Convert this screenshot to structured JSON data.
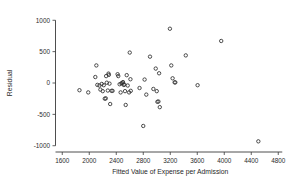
{
  "chart_data": {
    "type": "scatter",
    "title": "",
    "xlabel": "Fitted Value of Expense per Admission",
    "ylabel": "Residual",
    "xlim": [
      1500,
      4900
    ],
    "ylim": [
      -1100,
      1100
    ],
    "xticks": [
      1600,
      2000,
      2400,
      2800,
      3200,
      3600,
      4000,
      4400,
      4800
    ],
    "xtick_labels": [
      "1600",
      "2000",
      "2400",
      "2800",
      "3200",
      "3600",
      "4000",
      "4400",
      "4800"
    ],
    "yticks": [
      -1000,
      -500,
      0,
      500,
      1000
    ],
    "ytick_labels": [
      "-1000",
      "-500",
      "0",
      "500",
      "1000"
    ],
    "grid": false,
    "legend": null,
    "marker": "open-circle",
    "marker_color": "#2e2e2e",
    "points": [
      {
        "x": 1855,
        "y": -115
      },
      {
        "x": 1985,
        "y": -150
      },
      {
        "x": 2090,
        "y": 95
      },
      {
        "x": 2105,
        "y": 280
      },
      {
        "x": 2120,
        "y": -30
      },
      {
        "x": 2150,
        "y": -40
      },
      {
        "x": 2165,
        "y": -105
      },
      {
        "x": 2185,
        "y": -15
      },
      {
        "x": 2200,
        "y": -130
      },
      {
        "x": 2215,
        "y": -35
      },
      {
        "x": 2230,
        "y": -250
      },
      {
        "x": 2245,
        "y": -245
      },
      {
        "x": 2250,
        "y": 110
      },
      {
        "x": 2260,
        "y": 5
      },
      {
        "x": 2275,
        "y": -120
      },
      {
        "x": 2285,
        "y": 150
      },
      {
        "x": 2290,
        "y": 130
      },
      {
        "x": 2300,
        "y": -10
      },
      {
        "x": 2310,
        "y": -335
      },
      {
        "x": 2330,
        "y": -125
      },
      {
        "x": 2345,
        "y": -125
      },
      {
        "x": 2420,
        "y": 140
      },
      {
        "x": 2430,
        "y": 110
      },
      {
        "x": 2450,
        "y": -20
      },
      {
        "x": 2465,
        "y": -150
      },
      {
        "x": 2475,
        "y": -5
      },
      {
        "x": 2490,
        "y": 0
      },
      {
        "x": 2500,
        "y": 15
      },
      {
        "x": 2510,
        "y": -30
      },
      {
        "x": 2520,
        "y": -25
      },
      {
        "x": 2530,
        "y": -130
      },
      {
        "x": 2540,
        "y": -350
      },
      {
        "x": 2555,
        "y": 125
      },
      {
        "x": 2570,
        "y": -40
      },
      {
        "x": 2590,
        "y": -150
      },
      {
        "x": 2600,
        "y": 485
      },
      {
        "x": 2610,
        "y": 60
      },
      {
        "x": 2615,
        "y": -125
      },
      {
        "x": 2745,
        "y": -80
      },
      {
        "x": 2800,
        "y": -685
      },
      {
        "x": 2820,
        "y": 55
      },
      {
        "x": 2845,
        "y": -185
      },
      {
        "x": 2900,
        "y": 420
      },
      {
        "x": 2950,
        "y": -95
      },
      {
        "x": 2985,
        "y": 230
      },
      {
        "x": 3000,
        "y": -130
      },
      {
        "x": 3010,
        "y": -300
      },
      {
        "x": 3025,
        "y": -295
      },
      {
        "x": 3035,
        "y": 155
      },
      {
        "x": 3045,
        "y": -385
      },
      {
        "x": 3195,
        "y": 865
      },
      {
        "x": 3215,
        "y": 280
      },
      {
        "x": 3235,
        "y": 75
      },
      {
        "x": 3265,
        "y": 10
      },
      {
        "x": 3275,
        "y": 10
      },
      {
        "x": 3430,
        "y": 440
      },
      {
        "x": 3605,
        "y": -35
      },
      {
        "x": 3955,
        "y": 670
      },
      {
        "x": 4505,
        "y": -930
      }
    ]
  },
  "axes": {
    "y_axis_name": "residual-axis",
    "x_axis_name": "fitted-value-axis"
  }
}
